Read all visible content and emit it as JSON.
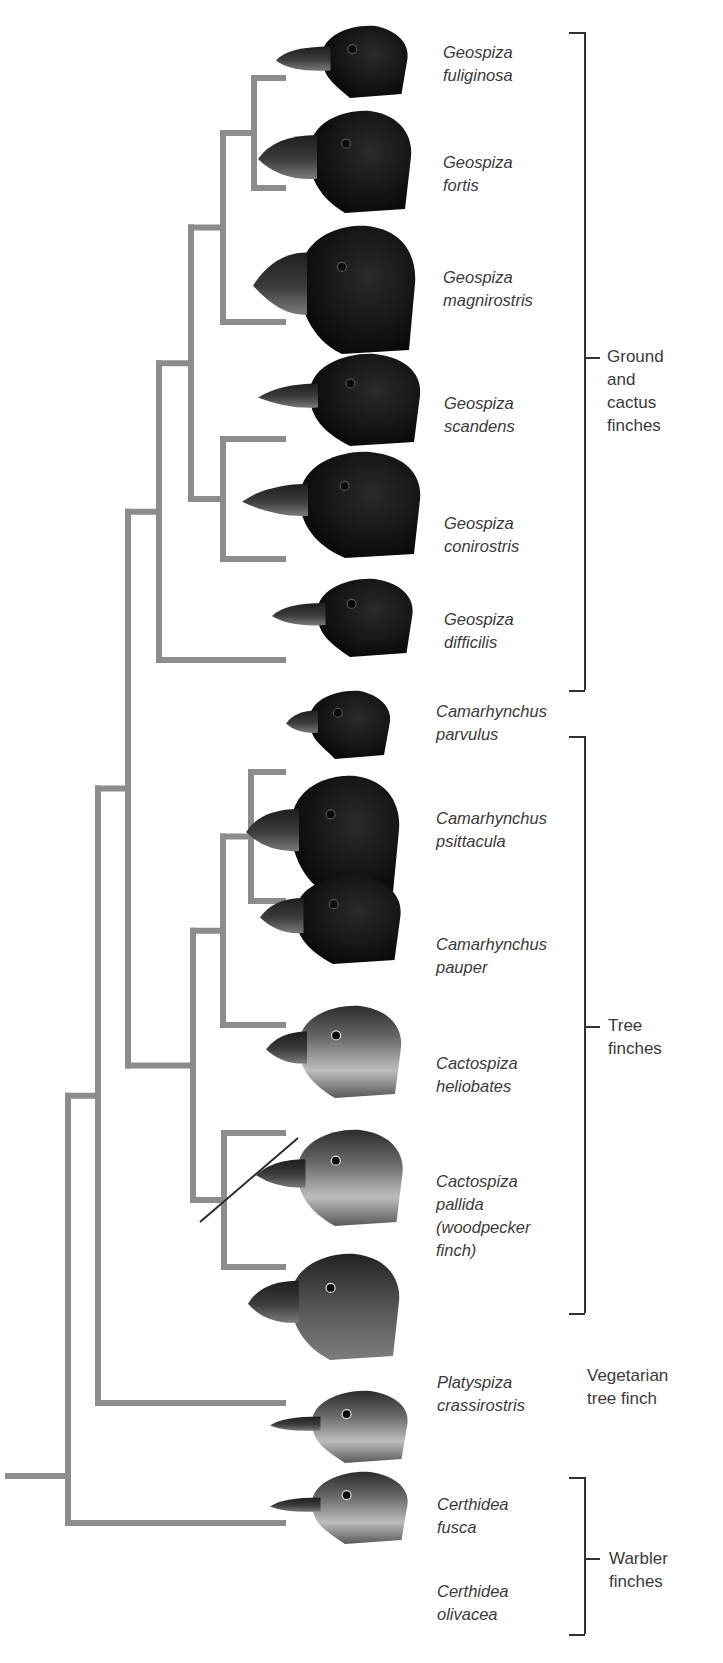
{
  "figure": {
    "type": "phylogenetic-tree",
    "colors": {
      "branch": "#8c8c8c",
      "text": "#3a3a3a",
      "bracket": "#333333",
      "dark_plumage": "#141414",
      "light_plumage": "#6e6e6e"
    }
  },
  "species": [
    {
      "id": "fuliginosa",
      "label": "Geospiza\nfuliginosa",
      "plumage": "dark",
      "beak": "small-crushing"
    },
    {
      "id": "fortis",
      "label": "Geospiza\nfortis",
      "plumage": "dark",
      "beak": "medium-crushing"
    },
    {
      "id": "magnirostris",
      "label": "Geospiza\nmagnirostris",
      "plumage": "dark",
      "beak": "large-crushing"
    },
    {
      "id": "scandens",
      "label": "Geospiza\nscandens",
      "plumage": "dark",
      "beak": "long-probing"
    },
    {
      "id": "conirostris",
      "label": "Geospiza\nconirostris",
      "plumage": "dark",
      "beak": "long-conical"
    },
    {
      "id": "difficilis",
      "label": "Geospiza\ndifficilis",
      "plumage": "dark",
      "beak": "small-pointed"
    },
    {
      "id": "parvulus",
      "label": "Camarhynchus\nparvulus",
      "plumage": "dark",
      "beak": "small-grasping"
    },
    {
      "id": "psittacula",
      "label": "Camarhynchus\npsittacula",
      "plumage": "dark",
      "beak": "parrot-like"
    },
    {
      "id": "pauper",
      "label": "Camarhynchus\npauper",
      "plumage": "dark",
      "beak": "grasping"
    },
    {
      "id": "heliobates",
      "label": "Cactospiza\nheliobates",
      "plumage": "light",
      "beak": "probing"
    },
    {
      "id": "pallida",
      "label": "Cactospiza\npallida\n(woodpecker\nfinch)",
      "plumage": "light",
      "beak": "probing-with-tool"
    },
    {
      "id": "crassirostris",
      "label": "Platyspiza\ncrassirostris",
      "plumage": "medium",
      "beak": "parrot-like"
    },
    {
      "id": "fusca",
      "label": "Certhidea\nfusca",
      "plumage": "light",
      "beak": "thin-warbler"
    },
    {
      "id": "olivacea",
      "label": "Certhidea\nolivacea",
      "plumage": "light",
      "beak": "thin-warbler"
    }
  ],
  "tree": {
    "newick": "(((((((fuliginosa,fortis),magnirostris),(scandens,conirostris)),difficilis),(((parvulus,psittacula),pauper),(heliobates,pallida))),crassirostris),fusca),olivacea);"
  },
  "groups": [
    {
      "id": "ground",
      "label": "Ground\nand\ncactus\nfinches",
      "members": [
        "fuliginosa",
        "fortis",
        "magnirostris",
        "scandens",
        "conirostris",
        "difficilis"
      ],
      "bracket": true
    },
    {
      "id": "tree",
      "label": "Tree\nfinches",
      "members": [
        "parvulus",
        "psittacula",
        "pauper",
        "heliobates",
        "pallida"
      ],
      "bracket": true
    },
    {
      "id": "vegetarian",
      "label": "Vegetarian\ntree finch",
      "members": [
        "crassirostris"
      ],
      "bracket": false
    },
    {
      "id": "warbler",
      "label": "Warbler\nfinches",
      "members": [
        "fusca",
        "olivacea"
      ],
      "bracket": true
    }
  ]
}
